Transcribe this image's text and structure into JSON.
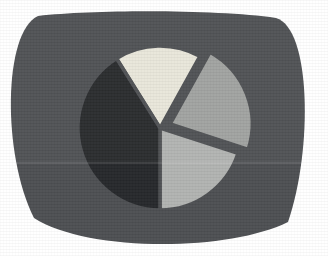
{
  "figure": {
    "title": "",
    "panel_shape": "rounded-barrel-screen",
    "panel_color": "#4d4f52",
    "page_background": "#ffffff"
  },
  "chart_data": {
    "type": "pie",
    "title": "",
    "xlabel": "",
    "ylabel": "",
    "legend": "none",
    "grid": false,
    "center": {
      "cx": 160,
      "cy": 128
    },
    "radius": 82,
    "start_angle_deg": 118,
    "direction": "counterclockwise",
    "categories": [
      "Slice A",
      "Slice B",
      "Slice C",
      "Slice D"
    ],
    "values": [
      17,
      22,
      19,
      42
    ],
    "percentages": [
      "17%",
      "22%",
      "19%",
      "42%"
    ],
    "colors": [
      "#e8e6da",
      "#a0a2a0",
      "#b0b2b0",
      "#26282b"
    ],
    "explode": [
      0,
      0.13,
      0,
      0
    ],
    "slices": [
      {
        "label": "Slice A",
        "value": 17,
        "percent": "17%",
        "color": "#e8e6da",
        "name": "pie-slice-light-cream",
        "start_deg": 61,
        "end_deg": 122,
        "exploded": false,
        "offset": 0
      },
      {
        "label": "Slice B",
        "value": 22,
        "percent": "22%",
        "color": "#9fa19f",
        "name": "pie-slice-medium-gray-exploded",
        "start_deg": -18,
        "end_deg": 61,
        "exploded": true,
        "offset": 11
      },
      {
        "label": "Slice C",
        "value": 19,
        "percent": "19%",
        "color": "#b1b3b1",
        "name": "pie-slice-light-gray",
        "start_deg": -90,
        "end_deg": -18,
        "exploded": false,
        "offset": 0
      },
      {
        "label": "Slice D",
        "value": 42,
        "percent": "42%",
        "color": "#26282b",
        "name": "pie-slice-dark",
        "start_deg": 122,
        "end_deg": 270,
        "exploded": false,
        "offset": 0
      }
    ]
  }
}
